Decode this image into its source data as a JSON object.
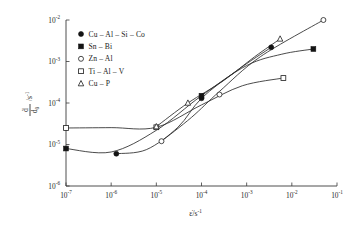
{
  "chart_data": {
    "type": "line",
    "title": "",
    "xlabel": "ε̇/s⁻¹",
    "ylabel": "ḋ/d₀ /s⁻¹",
    "xscale": "log",
    "yscale": "log",
    "xlim": [
      1e-07,
      0.1
    ],
    "ylim": [
      1e-06,
      0.01
    ],
    "grid": false,
    "legend_position": "upper-left-inside",
    "xticks": [
      "10⁻⁷",
      "10⁻⁶",
      "10⁻⁵",
      "10⁻⁴",
      "10⁻³",
      "10⁻²",
      "10⁻¹"
    ],
    "xtick_values": [
      1e-07,
      1e-06,
      1e-05,
      0.0001,
      0.001,
      0.01,
      0.1
    ],
    "yticks": [
      "10⁻²",
      "10⁻³",
      "10⁻⁴",
      "10⁻⁵",
      "10⁻⁶"
    ],
    "ytick_values": [
      0.01,
      0.001,
      0.0001,
      1e-05,
      1e-06
    ],
    "series": [
      {
        "name": "Cu-Al-Si-Co",
        "marker": "filled-circle",
        "x": [
          1.3e-06,
          0.0001,
          0.0035
        ],
        "y": [
          6e-06,
          0.00013,
          0.0022
        ]
      },
      {
        "name": "Sn-Bi",
        "marker": "filled-square",
        "x": [
          1e-07,
          0.0001,
          0.03
        ],
        "y": [
          8e-06,
          0.00015,
          0.002
        ]
      },
      {
        "name": "Zn-Al",
        "marker": "open-circle",
        "x": [
          1.3e-05,
          0.00025,
          0.05
        ],
        "y": [
          1.2e-05,
          0.00016,
          0.01
        ]
      },
      {
        "name": "Ti-Al-V",
        "marker": "open-square",
        "x": [
          1e-07,
          1e-05,
          0.0065
        ],
        "y": [
          2.5e-05,
          2.6e-05,
          0.0004
        ]
      },
      {
        "name": "Cu-P",
        "marker": "open-triangle",
        "x": [
          1e-05,
          5e-05,
          0.0055
        ],
        "y": [
          2.7e-05,
          0.0001,
          0.0035
        ]
      }
    ]
  },
  "axes": {
    "x_label_base": "ε̇/s",
    "x_label_exp": "-1",
    "y_label_numerator": "ḋ",
    "y_label_denominator": "d",
    "y_label_denominator_sub": "0",
    "y_label_unit_base": "/s",
    "y_label_unit_exp": "-1"
  },
  "legend": {
    "items": [
      {
        "marker": "filled-circle",
        "label": "Cu – Al – Si – Co"
      },
      {
        "marker": "filled-square",
        "label": "Sn – Bi"
      },
      {
        "marker": "open-circle",
        "label": "Zn – Al"
      },
      {
        "marker": "open-square",
        "label": "Ti – Al – V"
      },
      {
        "marker": "open-triangle",
        "label": "Cu – P"
      }
    ]
  },
  "tick_text": {
    "x": [
      {
        "base": "10",
        "exp": "-7"
      },
      {
        "base": "10",
        "exp": "-6"
      },
      {
        "base": "10",
        "exp": "-5"
      },
      {
        "base": "10",
        "exp": "-4"
      },
      {
        "base": "10",
        "exp": "-3"
      },
      {
        "base": "10",
        "exp": "-2"
      },
      {
        "base": "10",
        "exp": "-1"
      }
    ],
    "y": [
      {
        "base": "10",
        "exp": "-2"
      },
      {
        "base": "10",
        "exp": "-3"
      },
      {
        "base": "10",
        "exp": "-4"
      },
      {
        "base": "10",
        "exp": "-5"
      },
      {
        "base": "10",
        "exp": "-6"
      }
    ]
  },
  "style": {
    "axis_color": "#3a3a3a",
    "curve_color": "#2b2b2b",
    "marker_fill": "#141414",
    "background": "#ffffff"
  }
}
